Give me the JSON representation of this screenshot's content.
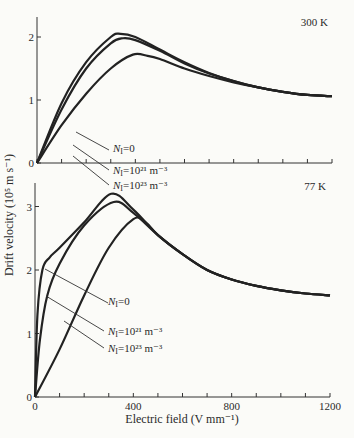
{
  "figure": {
    "ylabel": "Drift velocity (10⁵ m s⁻¹)",
    "xlabel": "Electric field (V mm⁻¹)",
    "x_ticks": [
      "0",
      "400",
      "800",
      "1200"
    ],
    "top": {
      "temperature": "300 K",
      "y_ticks": [
        "0",
        "1",
        "2"
      ],
      "legend": [
        {
          "sym": "N",
          "sub": "I",
          "text": "=0"
        },
        {
          "sym": "N",
          "sub": "I",
          "text": "=10²¹ m⁻³"
        },
        {
          "sym": "N",
          "sub": "I",
          "text": "=10²³ m⁻³"
        }
      ]
    },
    "bottom": {
      "temperature": "77 K",
      "y_ticks": [
        "0",
        "1",
        "2",
        "3"
      ],
      "legend": [
        {
          "sym": "N",
          "sub": "I",
          "text": "=0"
        },
        {
          "sym": "N",
          "sub": "I",
          "text": "=10²¹ m⁻³"
        },
        {
          "sym": "N",
          "sub": "I",
          "text": "=10²³ m⁻³"
        }
      ]
    }
  },
  "chart_data": [
    {
      "type": "line",
      "title": "300 K",
      "xlabel": "Electric field (V mm⁻¹)",
      "ylabel": "Drift velocity (10⁵ m s⁻¹)",
      "xlim": [
        0,
        1200
      ],
      "ylim": [
        0,
        2.3
      ],
      "x_ticks": [
        0,
        100,
        200,
        300,
        400,
        500,
        600,
        700,
        800,
        900,
        1000,
        1100,
        1200
      ],
      "y_ticks": [
        0,
        1,
        2
      ],
      "grid": false,
      "series": [
        {
          "name": "N_I=0",
          "x": [
            0,
            100,
            200,
            300,
            340,
            400,
            500,
            600,
            700,
            800,
            900,
            1000,
            1100,
            1200
          ],
          "y": [
            0,
            0.95,
            1.6,
            2.0,
            2.05,
            2.0,
            1.8,
            1.6,
            1.43,
            1.3,
            1.2,
            1.13,
            1.08,
            1.06
          ]
        },
        {
          "name": "N_I=10^21 m^-3",
          "x": [
            0,
            100,
            200,
            300,
            350,
            400,
            500,
            600,
            700,
            800,
            900,
            1000,
            1100,
            1200
          ],
          "y": [
            0,
            0.85,
            1.5,
            1.9,
            1.98,
            1.95,
            1.78,
            1.58,
            1.42,
            1.3,
            1.2,
            1.13,
            1.08,
            1.06
          ]
        },
        {
          "name": "N_I=10^23 m^-3",
          "x": [
            0,
            100,
            200,
            300,
            390,
            450,
            500,
            600,
            700,
            800,
            900,
            1000,
            1100,
            1200
          ],
          "y": [
            0,
            0.6,
            1.1,
            1.5,
            1.72,
            1.7,
            1.65,
            1.5,
            1.38,
            1.28,
            1.2,
            1.13,
            1.08,
            1.06
          ]
        }
      ],
      "annotations": [
        "300 K"
      ]
    },
    {
      "type": "line",
      "title": "77 K",
      "xlabel": "Electric field (V mm⁻¹)",
      "ylabel": "Drift velocity (10⁵ m s⁻¹)",
      "xlim": [
        0,
        1200
      ],
      "ylim": [
        0,
        3.4
      ],
      "x_ticks": [
        0,
        100,
        200,
        300,
        400,
        500,
        600,
        700,
        800,
        900,
        1000,
        1100,
        1200
      ],
      "y_ticks": [
        0,
        1,
        2,
        3
      ],
      "grid": false,
      "series": [
        {
          "name": "N_I=0",
          "x": [
            0,
            10,
            30,
            60,
            100,
            200,
            310,
            400,
            500,
            600,
            700,
            800,
            900,
            1000,
            1100,
            1200
          ],
          "y": [
            0,
            1.3,
            2.0,
            2.2,
            2.35,
            2.75,
            3.2,
            2.95,
            2.55,
            2.25,
            2.0,
            1.85,
            1.75,
            1.68,
            1.63,
            1.6
          ]
        },
        {
          "name": "N_I=10^21 m^-3",
          "x": [
            0,
            20,
            50,
            100,
            200,
            320,
            400,
            500,
            600,
            700,
            800,
            900,
            1000,
            1100,
            1200
          ],
          "y": [
            0,
            0.9,
            1.6,
            2.1,
            2.7,
            3.07,
            2.9,
            2.55,
            2.25,
            2.0,
            1.85,
            1.75,
            1.68,
            1.63,
            1.6
          ]
        },
        {
          "name": "N_I=10^23 m^-3",
          "x": [
            0,
            100,
            200,
            300,
            400,
            450,
            500,
            600,
            700,
            800,
            900,
            1000,
            1100,
            1200
          ],
          "y": [
            0,
            0.75,
            1.6,
            2.35,
            2.8,
            2.75,
            2.55,
            2.25,
            2.0,
            1.85,
            1.75,
            1.68,
            1.63,
            1.6
          ]
        }
      ],
      "annotations": [
        "77 K"
      ]
    }
  ]
}
